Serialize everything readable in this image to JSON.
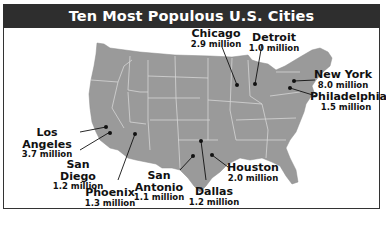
{
  "title": "Ten Most Populous U.S. Cities",
  "colors": {
    "land": "#9a9a9a",
    "state_border": "#d6d6d6",
    "title_bg": "#2e2e2e",
    "title_text": "#ffffff",
    "marker": "#111111"
  },
  "cities": [
    {
      "name": "Chicago",
      "population": "2.9 million"
    },
    {
      "name": "Detroit",
      "population": "1.0 million"
    },
    {
      "name": "New York",
      "population": "8.0 million"
    },
    {
      "name": "Philadelphia",
      "population": "1.5 million"
    },
    {
      "name": "Los Angeles",
      "population": "3.7 million"
    },
    {
      "name": "San Diego",
      "population": "1.2 million"
    },
    {
      "name": "Phoenix",
      "population": "1.3 million"
    },
    {
      "name": "San Antonio",
      "population": "1.1 million"
    },
    {
      "name": "Dallas",
      "population": "1.2 million"
    },
    {
      "name": "Houston",
      "population": "2.0 million"
    }
  ]
}
